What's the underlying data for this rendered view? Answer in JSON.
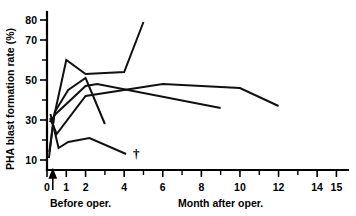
{
  "chart_data": {
    "type": "line",
    "title": "",
    "xlabel": "Month after oper.",
    "ylabel": "PHA blast formation rate (%)",
    "xlim": [
      0,
      15.6
    ],
    "ylim": [
      5,
      84
    ],
    "grid": false,
    "legend": "none",
    "x_ticks": [
      0,
      1,
      2,
      3,
      4,
      5,
      6,
      7,
      8,
      9,
      10,
      11,
      12,
      13,
      14,
      15
    ],
    "x_tick_labels": [
      "0",
      "1",
      "2",
      "",
      "4",
      "",
      "6",
      "",
      "8",
      "",
      "10",
      "",
      "12",
      "",
      "14",
      "15"
    ],
    "y_ticks": [
      10,
      20,
      30,
      40,
      50,
      60,
      70,
      80
    ],
    "y_tick_labels": [
      "10",
      "",
      "30",
      "",
      "50",
      "",
      "70",
      "80"
    ],
    "annotations": [
      {
        "name": "before-oper-arrow",
        "text": "Before oper.",
        "x": 0.3,
        "y": 5
      },
      {
        "name": "death-dagger",
        "text": "†",
        "x": 4.15,
        "y": 13
      }
    ],
    "series": [
      {
        "name": "patient-1",
        "points": [
          [
            0.1,
            11
          ],
          [
            0.35,
            31
          ],
          [
            1.0,
            60
          ],
          [
            2.0,
            53
          ],
          [
            4.0,
            54
          ],
          [
            5.0,
            79
          ]
        ]
      },
      {
        "name": "patient-2",
        "points": [
          [
            0.12,
            14
          ],
          [
            0.4,
            34
          ],
          [
            1.1,
            45
          ],
          [
            2.0,
            51
          ],
          [
            3.0,
            28
          ]
        ]
      },
      {
        "name": "patient-3",
        "points": [
          [
            0.14,
            29
          ],
          [
            0.45,
            33
          ],
          [
            2.0,
            47
          ],
          [
            2.6,
            48
          ],
          [
            9.0,
            36
          ]
        ]
      },
      {
        "name": "patient-4",
        "points": [
          [
            0.16,
            31
          ],
          [
            0.5,
            23
          ],
          [
            2.0,
            42
          ],
          [
            6.0,
            48
          ],
          [
            10.0,
            46
          ],
          [
            12.0,
            37
          ]
        ]
      },
      {
        "name": "patient-5",
        "points": [
          [
            0.18,
            33
          ],
          [
            0.6,
            16
          ],
          [
            1.1,
            19
          ],
          [
            2.2,
            21
          ],
          [
            4.1,
            13
          ]
        ]
      }
    ]
  },
  "axis_labels": {
    "y_title": "PHA blast formation rate (%)",
    "x_title": "Month after oper.",
    "before_oper": "Before oper."
  },
  "colors": {
    "line": "#111111",
    "axis": "#000000",
    "background": "#ffffff"
  }
}
